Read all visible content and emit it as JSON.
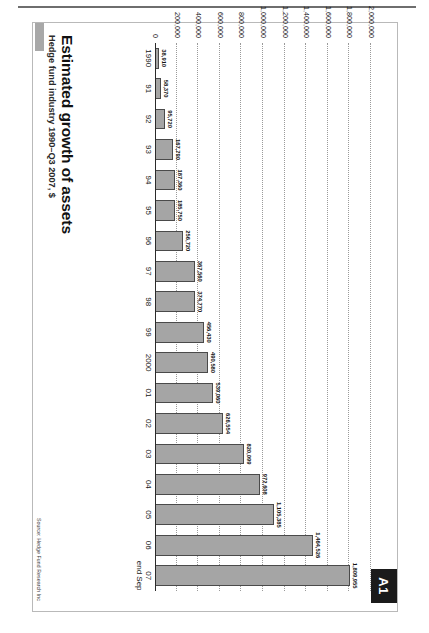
{
  "page": {
    "figure_tab": "A1"
  },
  "figure": {
    "title": "Estimated growth of assets",
    "subtitle": "Hedge fund industry 1990–Q3 2007, $",
    "source": "Source: Hedge Fund Research Inc"
  },
  "chart_data": {
    "type": "bar",
    "title": "Estimated growth of assets",
    "subtitle": "Hedge fund industry 1990–Q3 2007, $",
    "xlabel": "",
    "ylabel": "",
    "ylim": [
      0,
      2000000
    ],
    "grid": true,
    "legend": "none",
    "ytick_labels": [
      "2,000,000",
      "1,800,000",
      "1,600,000",
      "1,400,000",
      "1,200,000",
      "1,000,000",
      "800,000",
      "600,000",
      "400,000",
      "200,000",
      "0"
    ],
    "ytick_values": [
      2000000,
      1800000,
      1600000,
      1400000,
      1200000,
      1000000,
      800000,
      600000,
      400000,
      200000,
      0
    ],
    "categories": [
      "1990",
      "91",
      "92",
      "93",
      "94",
      "95",
      "96",
      "97",
      "98",
      "99",
      "2000",
      "01",
      "02",
      "03",
      "04",
      "05",
      "06",
      "07\nend Sep"
    ],
    "values": [
      38910,
      58370,
      95720,
      167790,
      187360,
      185750,
      256720,
      367560,
      374770,
      456430,
      490580,
      539060,
      626554,
      820099,
      972608,
      1105385,
      1464526,
      1809955
    ],
    "value_labels": [
      "38,910",
      "58,370",
      "95,720",
      "167,790",
      "187,360",
      "185,750",
      "256,720",
      "367,560",
      "374,770",
      "456,430",
      "490,580",
      "539,060",
      "626,554",
      "820,099",
      "972,608",
      "1,105,385",
      "1,464,526",
      "1,809,955"
    ],
    "bar_color": "#a5a5a5",
    "bar_border_color": "#4a4a4a",
    "source": "Source: Hedge Fund Research Inc"
  }
}
